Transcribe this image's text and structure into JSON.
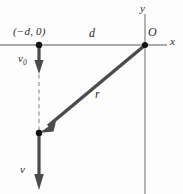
{
  "figure": {
    "background_color": "#fdfdfd",
    "axis_color": "#8c8c8c",
    "vector_color": "#4b4b4b",
    "dashed_color": "#9a9a9a",
    "dot_color": "#111111",
    "label_color": "#2b2b2b"
  },
  "axes": {
    "x_axis": {
      "label": "x",
      "y_pixel": 45,
      "x_start": 0,
      "x_end": 167
    },
    "y_axis": {
      "label": "y",
      "x_pixel": 145,
      "y_start": 14,
      "y_end": 194
    },
    "origin": {
      "label": "O",
      "x": 145,
      "y": 45
    }
  },
  "points": [
    {
      "name": "launch-point",
      "label": "(−d, 0)",
      "x": 39,
      "y": 45
    },
    {
      "name": "particle-point",
      "label": "",
      "x": 39,
      "y": 133
    }
  ],
  "distance_marker": {
    "label": "d",
    "from_x": 39,
    "to_x": 145,
    "y": 45
  },
  "vectors": [
    {
      "name": "v0-vector",
      "label": "v",
      "subscript": "0",
      "from": [
        39,
        45
      ],
      "to": [
        39,
        73
      ],
      "direction": "down"
    },
    {
      "name": "r-vector",
      "label": "r",
      "subscript": "",
      "from": [
        145,
        45
      ],
      "to": [
        41,
        131
      ],
      "direction": "down-left"
    },
    {
      "name": "v-vector",
      "label": "v",
      "subscript": "",
      "from": [
        39,
        133
      ],
      "to": [
        39,
        189
      ],
      "direction": "down"
    }
  ],
  "dashed_line": {
    "name": "trajectory-guide",
    "from": [
      39,
      45
    ],
    "to": [
      39,
      133
    ]
  }
}
